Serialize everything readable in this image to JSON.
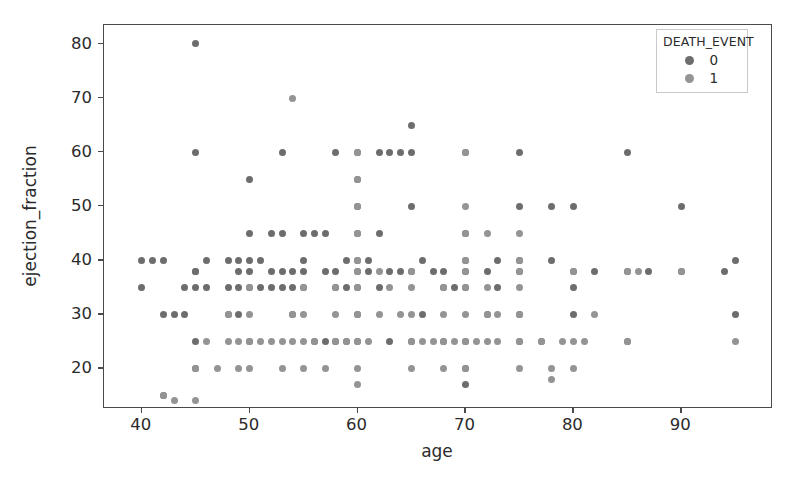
{
  "chart_data": {
    "type": "scatter",
    "title": "",
    "xlabel": "age",
    "ylabel": "ejection_fraction",
    "xlim": [
      36.5,
      98.5
    ],
    "ylim": [
      12.5,
      83.5
    ],
    "xticks": [
      40,
      50,
      60,
      70,
      80,
      90
    ],
    "yticks": [
      20,
      30,
      40,
      50,
      60,
      70,
      80
    ],
    "grid": false,
    "legend": {
      "title": "DEATH_EVENT",
      "position": "upper right",
      "entries": [
        {
          "label": "0",
          "color": "#6d6d6d"
        },
        {
          "label": "1",
          "color": "#949494"
        }
      ]
    },
    "series": [
      {
        "name": "0",
        "color": "#6d6d6d",
        "points": [
          [
            40,
            35
          ],
          [
            40,
            40
          ],
          [
            41,
            40
          ],
          [
            42,
            40
          ],
          [
            42,
            15
          ],
          [
            42,
            30
          ],
          [
            43,
            30
          ],
          [
            44,
            35
          ],
          [
            44,
            30
          ],
          [
            45,
            80
          ],
          [
            45,
            60
          ],
          [
            45,
            38
          ],
          [
            45,
            35
          ],
          [
            45,
            38
          ],
          [
            45,
            20
          ],
          [
            45,
            25
          ],
          [
            46,
            35
          ],
          [
            46,
            40
          ],
          [
            48,
            40
          ],
          [
            48,
            35
          ],
          [
            48,
            30
          ],
          [
            49,
            30
          ],
          [
            49,
            35
          ],
          [
            49,
            38
          ],
          [
            49,
            40
          ],
          [
            50,
            25
          ],
          [
            50,
            40
          ],
          [
            50,
            35
          ],
          [
            50,
            38
          ],
          [
            50,
            45
          ],
          [
            50,
            55
          ],
          [
            51,
            40
          ],
          [
            51,
            35
          ],
          [
            52,
            35
          ],
          [
            52,
            38
          ],
          [
            52,
            45
          ],
          [
            53,
            38
          ],
          [
            53,
            35
          ],
          [
            53,
            60
          ],
          [
            53,
            45
          ],
          [
            54,
            35
          ],
          [
            54,
            38
          ],
          [
            54,
            30
          ],
          [
            55,
            35
          ],
          [
            55,
            38
          ],
          [
            55,
            45
          ],
          [
            55,
            40
          ],
          [
            56,
            25
          ],
          [
            56,
            45
          ],
          [
            57,
            25
          ],
          [
            57,
            38
          ],
          [
            57,
            45
          ],
          [
            58,
            35
          ],
          [
            58,
            25
          ],
          [
            58,
            60
          ],
          [
            58,
            38
          ],
          [
            59,
            25
          ],
          [
            59,
            35
          ],
          [
            59,
            40
          ],
          [
            60,
            38
          ],
          [
            60,
            35
          ],
          [
            60,
            40
          ],
          [
            60,
            45
          ],
          [
            60,
            50
          ],
          [
            60,
            60
          ],
          [
            60,
            55
          ],
          [
            60,
            25
          ],
          [
            60,
            30
          ],
          [
            61,
            38
          ],
          [
            61,
            40
          ],
          [
            62,
            35
          ],
          [
            62,
            45
          ],
          [
            62,
            60
          ],
          [
            63,
            60
          ],
          [
            63,
            38
          ],
          [
            63,
            25
          ],
          [
            64,
            38
          ],
          [
            64,
            60
          ],
          [
            65,
            60
          ],
          [
            65,
            65
          ],
          [
            65,
            50
          ],
          [
            65,
            25
          ],
          [
            65,
            38
          ],
          [
            66,
            40
          ],
          [
            66,
            30
          ],
          [
            67,
            38
          ],
          [
            68,
            35
          ],
          [
            68,
            38
          ],
          [
            68,
            25
          ],
          [
            69,
            35
          ],
          [
            70,
            25
          ],
          [
            70,
            35
          ],
          [
            70,
            40
          ],
          [
            70,
            45
          ],
          [
            70,
            20
          ],
          [
            70,
            17
          ],
          [
            70,
            38
          ],
          [
            70,
            60
          ],
          [
            72,
            38
          ],
          [
            72,
            30
          ],
          [
            73,
            35
          ],
          [
            73,
            40
          ],
          [
            75,
            60
          ],
          [
            75,
            38
          ],
          [
            75,
            40
          ],
          [
            75,
            25
          ],
          [
            75,
            50
          ],
          [
            75,
            30
          ],
          [
            77,
            25
          ],
          [
            78,
            50
          ],
          [
            78,
            40
          ],
          [
            80,
            38
          ],
          [
            80,
            35
          ],
          [
            80,
            50
          ],
          [
            80,
            30
          ],
          [
            82,
            38
          ],
          [
            85,
            60
          ],
          [
            85,
            38
          ],
          [
            85,
            25
          ],
          [
            87,
            38
          ],
          [
            90,
            50
          ],
          [
            90,
            38
          ],
          [
            94,
            38
          ],
          [
            95,
            40
          ],
          [
            95,
            30
          ]
        ]
      },
      {
        "name": "1",
        "color": "#949494",
        "points": [
          [
            42,
            15
          ],
          [
            43,
            14
          ],
          [
            45,
            14
          ],
          [
            45,
            20
          ],
          [
            46,
            25
          ],
          [
            47,
            20
          ],
          [
            48,
            25
          ],
          [
            48,
            30
          ],
          [
            49,
            25
          ],
          [
            49,
            20
          ],
          [
            50,
            20
          ],
          [
            50,
            25
          ],
          [
            50,
            30
          ],
          [
            50,
            35
          ],
          [
            51,
            25
          ],
          [
            52,
            25
          ],
          [
            53,
            20
          ],
          [
            53,
            25
          ],
          [
            54,
            70
          ],
          [
            54,
            25
          ],
          [
            54,
            30
          ],
          [
            55,
            20
          ],
          [
            55,
            25
          ],
          [
            55,
            30
          ],
          [
            55,
            35
          ],
          [
            56,
            25
          ],
          [
            57,
            20
          ],
          [
            58,
            25
          ],
          [
            58,
            30
          ],
          [
            58,
            35
          ],
          [
            59,
            25
          ],
          [
            60,
            17
          ],
          [
            60,
            20
          ],
          [
            60,
            25
          ],
          [
            60,
            30
          ],
          [
            60,
            35
          ],
          [
            60,
            38
          ],
          [
            60,
            40
          ],
          [
            60,
            45
          ],
          [
            60,
            50
          ],
          [
            60,
            55
          ],
          [
            60,
            60
          ],
          [
            61,
            25
          ],
          [
            62,
            30
          ],
          [
            62,
            38
          ],
          [
            63,
            35
          ],
          [
            64,
            30
          ],
          [
            65,
            20
          ],
          [
            65,
            25
          ],
          [
            65,
            30
          ],
          [
            65,
            35
          ],
          [
            65,
            38
          ],
          [
            66,
            25
          ],
          [
            67,
            25
          ],
          [
            68,
            20
          ],
          [
            68,
            25
          ],
          [
            68,
            30
          ],
          [
            68,
            35
          ],
          [
            69,
            25
          ],
          [
            70,
            20
          ],
          [
            70,
            25
          ],
          [
            70,
            30
          ],
          [
            70,
            35
          ],
          [
            70,
            38
          ],
          [
            70,
            40
          ],
          [
            70,
            45
          ],
          [
            70,
            50
          ],
          [
            70,
            60
          ],
          [
            71,
            25
          ],
          [
            72,
            25
          ],
          [
            72,
            30
          ],
          [
            72,
            35
          ],
          [
            72,
            45
          ],
          [
            73,
            25
          ],
          [
            73,
            30
          ],
          [
            75,
            20
          ],
          [
            75,
            25
          ],
          [
            75,
            30
          ],
          [
            75,
            35
          ],
          [
            75,
            38
          ],
          [
            75,
            40
          ],
          [
            75,
            45
          ],
          [
            77,
            25
          ],
          [
            78,
            20
          ],
          [
            78,
            18
          ],
          [
            79,
            25
          ],
          [
            80,
            20
          ],
          [
            80,
            25
          ],
          [
            80,
            38
          ],
          [
            81,
            25
          ],
          [
            82,
            30
          ],
          [
            85,
            25
          ],
          [
            85,
            38
          ],
          [
            86,
            38
          ],
          [
            90,
            38
          ],
          [
            95,
            25
          ]
        ]
      }
    ]
  }
}
